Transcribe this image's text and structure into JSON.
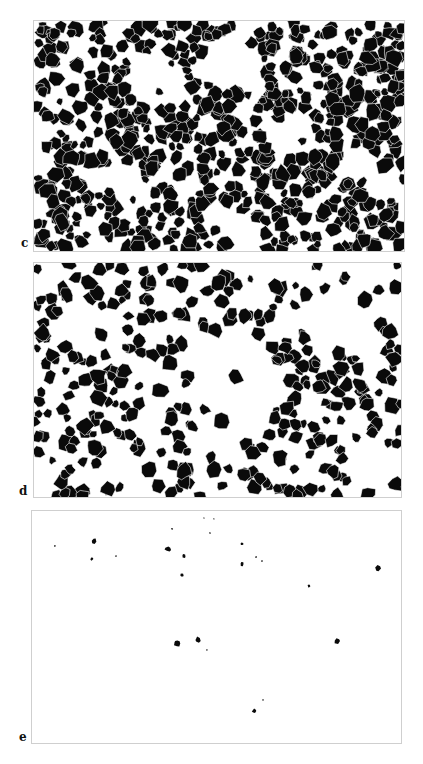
{
  "figure": {
    "panels": [
      {
        "label": "c",
        "density": "high",
        "description": "binary micrograph, dense black grains with white grain boundaries"
      },
      {
        "label": "d",
        "density": "medium",
        "description": "binary micrograph, medium density black grains"
      },
      {
        "label": "e",
        "density": "low",
        "description": "binary micrograph, sparse isolated black particles"
      }
    ]
  }
}
